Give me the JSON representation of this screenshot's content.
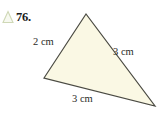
{
  "figure": {
    "exercise_number": "76.",
    "bullet_icon": "triangle-icon",
    "bullet_color": "#cfd8b6",
    "background_color": "#ffffff",
    "shape": {
      "name": "triangle",
      "type": "scalene-triangle",
      "fill_color": "#faf8e4",
      "stroke_color": "#4a4a42",
      "stroke_width": 1.2,
      "vertices": [
        {
          "name": "apex",
          "x": 86,
          "y": 14
        },
        {
          "name": "left",
          "x": 44,
          "y": 78
        },
        {
          "name": "bottom-right",
          "x": 155,
          "y": 106
        }
      ]
    },
    "side_labels": {
      "left": "2 cm",
      "right": "3 cm",
      "base": "3 cm"
    }
  }
}
